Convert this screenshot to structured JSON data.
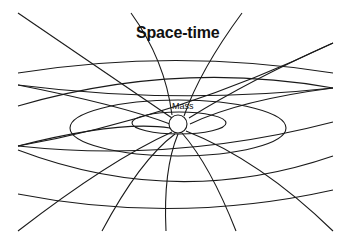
{
  "title": "Space-time",
  "mass_label": "Mass",
  "colors": {
    "stroke": "#1a1a1a",
    "background": "#ffffff"
  },
  "mass": {
    "cx": 178,
    "cy": 124,
    "r": 9
  },
  "ellipses": [
    {
      "cx": 179,
      "cy": 123,
      "rx": 47,
      "ry": 11
    },
    {
      "cx": 178,
      "cy": 128,
      "rx": 108,
      "ry": 28
    }
  ],
  "arcs": [
    "M18,73 Q176,48 333,73",
    "M18,106 Q176,60 333,88",
    "M18,85 Q176,105 333,88",
    "M18,146 Q176,118 333,43",
    "M18,150 Q176,210 333,156",
    "M18,194 Q176,225 333,190",
    "M18,146 Q176,163 333,122"
  ],
  "radials": [
    "M18,13 L172,118",
    "M131,13 Q165,60 172,115",
    "M242,13 Q200,70 184,116",
    "M333,43 Q250,80 189,118",
    "M18,85 Q120,105 170,124",
    "M333,88 Q240,100 190,124",
    "M18,146 Q120,120 170,128",
    "M18,231 Q110,160 172,132",
    "M102,231 Q140,160 175,134",
    "M166,231 Q163,170 178,134",
    "M236,231 Q210,165 182,133",
    "M333,231 Q260,160 186,131"
  ]
}
